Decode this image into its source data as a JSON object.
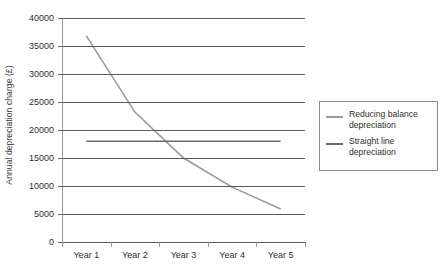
{
  "chart_data": {
    "type": "line",
    "title": "",
    "xlabel": "",
    "ylabel": "Annual depreciation charge (£)",
    "categories": [
      "Year 1",
      "Year 2",
      "Year 3",
      "Year 4",
      "Year 5"
    ],
    "ylim": [
      0,
      40000
    ],
    "yticks": [
      0,
      5000,
      10000,
      15000,
      20000,
      25000,
      30000,
      35000,
      40000
    ],
    "ytick_labels": [
      "0",
      "5000",
      "10000",
      "15000",
      "20000",
      "25000",
      "30000",
      "35000",
      "40000"
    ],
    "grid": true,
    "legend_position": "right",
    "series": [
      {
        "name": "Reducing balance\ndepreciation",
        "color": "#9a9a9a",
        "values": [
          36800,
          23200,
          15000,
          9800,
          5900
        ]
      },
      {
        "name": "Straight line\ndepreciation",
        "color": "#6b6b6b",
        "values": [
          18000,
          18000,
          18000,
          18000,
          18000
        ]
      }
    ]
  },
  "legend": {
    "entries": [
      {
        "label": "Reducing balance\ndepreciation",
        "color": "#9a9a9a"
      },
      {
        "label": "Straight line\ndepreciation",
        "color": "#6b6b6b"
      }
    ]
  }
}
